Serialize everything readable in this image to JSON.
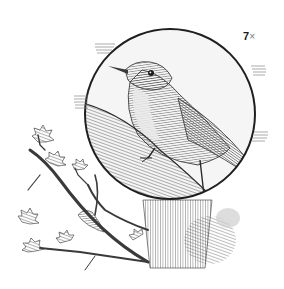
{
  "illustration": {
    "subject": "bird perched on branch, pen-and-ink engraving",
    "magnification": {
      "number": "7",
      "symbol": "×"
    },
    "colors": {
      "background": "#ffffff",
      "ink": "#2a2a2a",
      "circle_fill": "#f4f4f4",
      "bark": "#6a6a6a",
      "bird_dark": "#3c3c3c",
      "bird_light": "#e8e8e8"
    }
  }
}
